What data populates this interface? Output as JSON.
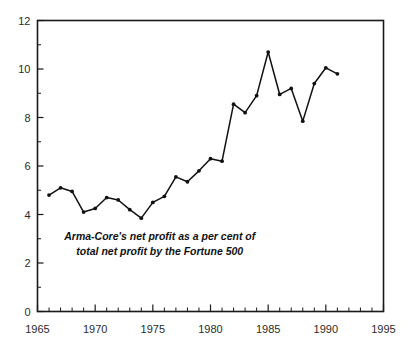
{
  "chart_data": {
    "type": "line",
    "title": "",
    "subtitle": "",
    "xlabel": "",
    "ylabel": "",
    "xlim": [
      1965,
      1995
    ],
    "ylim": [
      0,
      12
    ],
    "grid": false,
    "legend_position": "none",
    "x_tick_labels": [
      "1965",
      "1970",
      "1975",
      "1980",
      "1985",
      "1990",
      "1995"
    ],
    "x_tick_values": [
      1965,
      1970,
      1975,
      1980,
      1985,
      1990,
      1995
    ],
    "x_minor_tick_step": 1,
    "y_tick_labels": [
      "0",
      "2",
      "4",
      "6",
      "8",
      "10",
      "12"
    ],
    "y_tick_values": [
      0,
      2,
      4,
      6,
      8,
      10,
      12
    ],
    "y_minor_tick_step": 1,
    "annotations": [
      {
        "text": "Arma-Core's net profit as a per cent of",
        "x": 1975.6,
        "y": 2.95
      },
      {
        "text": "total net profit by the Fortune 500",
        "x": 1975.6,
        "y": 2.35
      }
    ],
    "series": [
      {
        "name": "Arma-Core's net profit as a per cent of total net profit by the Fortune 500",
        "color": "#111111",
        "marker": "circle",
        "x": [
          1966,
          1967,
          1968,
          1969,
          1970,
          1971,
          1972,
          1973,
          1974,
          1975,
          1976,
          1977,
          1978,
          1979,
          1980,
          1981,
          1982,
          1983,
          1984,
          1985,
          1986,
          1987,
          1988,
          1989,
          1990,
          1991
        ],
        "values": [
          4.8,
          5.1,
          4.95,
          4.1,
          4.25,
          4.7,
          4.6,
          4.2,
          3.85,
          4.5,
          4.75,
          5.55,
          5.35,
          5.8,
          6.3,
          6.2,
          8.55,
          8.2,
          8.9,
          10.7,
          8.95,
          9.2,
          7.85,
          9.4,
          10.05,
          9.8
        ]
      }
    ]
  },
  "colors": {
    "axis": "#1a1a1a",
    "line": "#111111",
    "marker": "#111111",
    "background": "#ffffff",
    "tick_text": "#2b2b2b"
  }
}
